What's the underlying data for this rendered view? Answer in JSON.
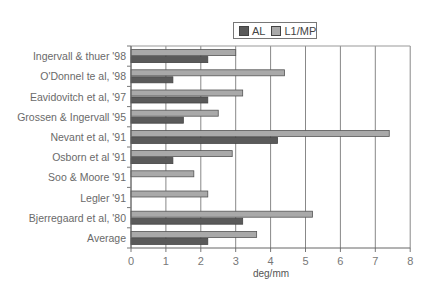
{
  "chart_data": {
    "type": "bar",
    "orientation": "horizontal",
    "title": "",
    "xlabel": "deg/mm",
    "ylabel": "",
    "xlim": [
      0,
      8
    ],
    "xticks": [
      0,
      1,
      2,
      3,
      4,
      5,
      6,
      7,
      8
    ],
    "grid": "vertical",
    "legend_position": "top-right",
    "categories": [
      "Ingervall & thuer '98",
      "O'Donnel te al, '98",
      "Eavidovitch et al, '97",
      "Grossen & Ingervall '95",
      "Nevant et al, '91",
      "Osborn et al '91",
      "Soo & Moore '91",
      "Legler '91",
      "Bjerregaard et al, '80",
      "Average"
    ],
    "series": [
      {
        "name": "AL",
        "color": "#5a5a5a",
        "values": [
          2.2,
          1.2,
          2.2,
          1.5,
          4.2,
          1.2,
          null,
          null,
          3.2,
          2.2
        ]
      },
      {
        "name": "L1/MP",
        "color": "#a9a9a9",
        "values": [
          3.0,
          4.4,
          3.2,
          2.5,
          7.4,
          2.9,
          1.8,
          2.2,
          5.2,
          3.6
        ]
      }
    ]
  },
  "legend": {
    "items": [
      {
        "label": "AL",
        "color": "#5a5a5a"
      },
      {
        "label": "L1/MP",
        "color": "#a9a9a9"
      }
    ]
  }
}
